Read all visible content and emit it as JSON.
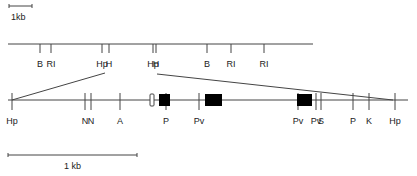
{
  "colors": {
    "line": "#444444",
    "box": "#000000",
    "bg": "#ffffff"
  },
  "top_scale": {
    "label": "1kb",
    "x1": 9,
    "x2": 32,
    "y": 6
  },
  "bottom_scale": {
    "label": "1 kb",
    "x1": 8,
    "x2": 137,
    "y": 155
  },
  "top_map": {
    "x1": 8,
    "x2": 313,
    "y": 44,
    "sites": [
      {
        "label": "B",
        "x": 40
      },
      {
        "label": "RI",
        "x": 51
      },
      {
        "label": "Hp",
        "x": 102
      },
      {
        "label": "H",
        "x": 109
      },
      {
        "label": "Hp",
        "x": 153
      },
      {
        "label": "H",
        "x": 156
      },
      {
        "label": "B",
        "x": 207
      },
      {
        "label": "RI",
        "x": 231
      },
      {
        "label": "RI",
        "x": 264
      }
    ]
  },
  "bottom_map": {
    "x1": 8,
    "x2": 408,
    "y": 100,
    "sites": [
      {
        "label": "Hp",
        "x": 12
      },
      {
        "label": "N",
        "x": 85
      },
      {
        "label": "N",
        "x": 91
      },
      {
        "label": "A",
        "x": 120
      },
      {
        "label": "P",
        "x": 166
      },
      {
        "label": "Pv",
        "x": 199
      },
      {
        "label": "Pv",
        "x": 298
      },
      {
        "label": "Pv",
        "x": 316
      },
      {
        "label": "S",
        "x": 321
      },
      {
        "label": "P",
        "x": 353
      },
      {
        "label": "K",
        "x": 369
      },
      {
        "label": "Hp",
        "x": 395
      }
    ],
    "boxes": [
      {
        "type": "open",
        "x": 150,
        "w": 4,
        "y": 94,
        "h": 12
      },
      {
        "type": "filled",
        "x": 159,
        "w": 11,
        "y": 94,
        "h": 12
      },
      {
        "type": "filled",
        "x": 205,
        "w": 17,
        "y": 94,
        "h": 12
      },
      {
        "type": "filled",
        "x": 297,
        "w": 15,
        "y": 94,
        "h": 12
      }
    ]
  },
  "expansion_lines": [
    {
      "x1": 105,
      "y1": 73,
      "x2": 12,
      "y2": 100
    },
    {
      "x1": 157,
      "y1": 74,
      "x2": 393,
      "y2": 100
    }
  ]
}
